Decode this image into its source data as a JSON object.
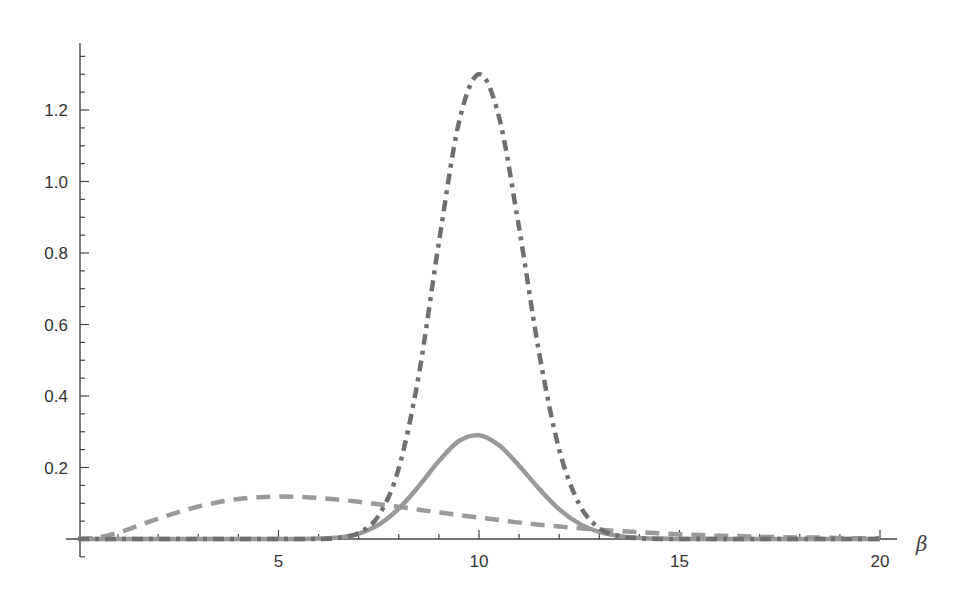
{
  "chart_data": {
    "type": "line",
    "title": "",
    "xlabel": "β",
    "ylabel": "",
    "xlim": [
      0,
      20.4
    ],
    "ylim": [
      -0.05,
      1.38
    ],
    "grid": false,
    "legend": null,
    "x_ticks": [
      5,
      10,
      15,
      20
    ],
    "x_tick_labels": [
      "5",
      "10",
      "15",
      "20"
    ],
    "y_ticks": [
      0.2,
      0.4,
      0.6,
      0.8,
      1.0,
      1.2
    ],
    "y_tick_labels": [
      "0.2",
      "0.4",
      "0.6",
      "0.8",
      "1.0",
      "1.2"
    ],
    "x": [
      0,
      0.5,
      1,
      1.5,
      2,
      2.5,
      3,
      3.5,
      4,
      4.5,
      5,
      5.5,
      6,
      6.5,
      7,
      7.5,
      8,
      8.5,
      9,
      9.5,
      10,
      10.5,
      11,
      11.5,
      12,
      12.5,
      13,
      13.5,
      14,
      14.5,
      15,
      15.5,
      16,
      16.5,
      17,
      17.5,
      18,
      18.5,
      19,
      19.5,
      20
    ],
    "series": [
      {
        "name": "dashed",
        "style": "dashed",
        "color": "#9a9a9a",
        "values": [
          0,
          0.004,
          0.018,
          0.037,
          0.057,
          0.075,
          0.091,
          0.103,
          0.112,
          0.117,
          0.119,
          0.118,
          0.115,
          0.11,
          0.104,
          0.097,
          0.09,
          0.082,
          0.074,
          0.067,
          0.06,
          0.053,
          0.046,
          0.04,
          0.035,
          0.03,
          0.026,
          0.022,
          0.019,
          0.016,
          0.013,
          0.011,
          0.009,
          0.008,
          0.006,
          0.005,
          0.004,
          0.004,
          0.003,
          0.002,
          0.002
        ]
      },
      {
        "name": "solid",
        "style": "solid",
        "color": "#999999",
        "values": [
          0,
          0,
          0,
          0,
          0,
          0,
          0,
          0,
          0,
          0,
          0,
          0,
          0.001,
          0.004,
          0.015,
          0.04,
          0.085,
          0.148,
          0.218,
          0.274,
          0.29,
          0.262,
          0.205,
          0.14,
          0.083,
          0.043,
          0.02,
          0.008,
          0.003,
          0.001,
          0,
          0,
          0,
          0,
          0,
          0,
          0,
          0,
          0,
          0,
          0
        ]
      },
      {
        "name": "dot-dashed",
        "style": "dot-dash",
        "color": "#6f6f6f",
        "values": [
          0,
          0,
          0,
          0,
          0,
          0,
          0,
          0,
          0,
          0,
          0,
          0,
          0,
          0.003,
          0.017,
          0.066,
          0.198,
          0.46,
          0.83,
          1.165,
          1.3,
          1.18,
          0.87,
          0.52,
          0.25,
          0.097,
          0.03,
          0.008,
          0.002,
          0,
          0,
          0,
          0,
          0,
          0,
          0,
          0,
          0,
          0,
          0,
          0
        ]
      }
    ]
  }
}
